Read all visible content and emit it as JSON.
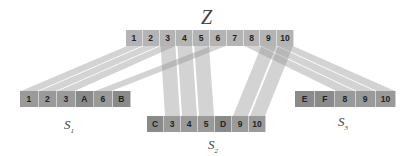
{
  "title": "Z",
  "colors": {
    "z_box": "#b4b4b4",
    "s_box": "#9a9a9a",
    "band": "#8c8c8c"
  },
  "z": {
    "x": 126,
    "y": 30,
    "cell_w": 16.8,
    "items": [
      "1",
      "2",
      "3",
      "4",
      "5",
      "6",
      "7",
      "8",
      "9",
      "10"
    ]
  },
  "groups": [
    {
      "id": "s1",
      "label_main": "S",
      "label_sub": "1",
      "x": 20,
      "y": 91,
      "cell_w": 18.5,
      "items": [
        "1",
        "2",
        "3",
        "A",
        "6",
        "B"
      ],
      "label_x": 64,
      "label_y": 117
    },
    {
      "id": "s2",
      "label_main": "S",
      "label_sub": "2",
      "x": 147,
      "y": 116,
      "cell_w": 17,
      "items": [
        "C",
        "3",
        "4",
        "5",
        "D",
        "9",
        "10"
      ],
      "label_x": 208,
      "label_y": 137
    },
    {
      "id": "s3",
      "label_main": "S",
      "label_sub": "3",
      "x": 295,
      "y": 91,
      "cell_w": 20.2,
      "items": [
        "E",
        "F",
        "8",
        "9",
        "10"
      ],
      "label_x": 338,
      "label_y": 114
    }
  ]
}
